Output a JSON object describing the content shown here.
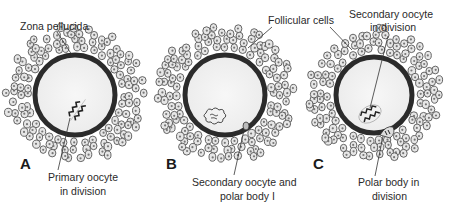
{
  "figure": {
    "colors": {
      "zona_pellucida": "#2b2b2b",
      "cytoplasm": "#f3f3f3",
      "follicular_cell_outline": "#555555",
      "follicular_cell_fill": "#e6e6e6",
      "label_text": "#2a2a2a",
      "leader_line": "#333333"
    },
    "panels": [
      {
        "id": "A",
        "letter": "A",
        "center": [
          75,
          95
        ],
        "radius": 40,
        "labels": [
          {
            "key": "zona",
            "lines": [
              "Zona pellucida"
            ]
          },
          {
            "key": "primary",
            "lines": [
              "Primary oocyte",
              "in division"
            ]
          }
        ],
        "nucleus": "metaphase-spindle"
      },
      {
        "id": "B",
        "letter": "B",
        "center": [
          225,
          95
        ],
        "radius": 40,
        "labels": [
          {
            "key": "secondary_polar",
            "lines": [
              "Secondary oocyte and",
              "polar body I"
            ]
          }
        ],
        "nucleus": "interphase-chromatin"
      },
      {
        "id": "C",
        "letter": "C",
        "center": [
          374,
          95
        ],
        "radius": 38,
        "labels": [
          {
            "key": "secondary_division",
            "lines": [
              "Secondary oocyte",
              "in division"
            ]
          },
          {
            "key": "polar_division",
            "lines": [
              "Polar body in",
              "division"
            ]
          }
        ],
        "nucleus": "metaphase-spindle"
      }
    ],
    "shared_labels": {
      "follicular": "Follicular cells"
    },
    "text": {
      "zona_pellucida": "Zona pellucida",
      "primary_1": "Primary oocyte",
      "primary_2": "in division",
      "follicular_cells": "Follicular cells",
      "secondary_div_1": "Secondary oocyte",
      "secondary_div_2": "in division",
      "secondary_polar_1": "Secondary oocyte and",
      "secondary_polar_2": "polar body I",
      "polar_div_1": "Polar body in",
      "polar_div_2": "division",
      "letter_a": "A",
      "letter_b": "B",
      "letter_c": "C"
    }
  }
}
